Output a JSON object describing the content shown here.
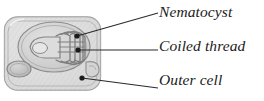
{
  "figure": {
    "name": "nematocyst-cnidocyte-diagram",
    "type": "labeled biological diagram",
    "background_color": "#ffffff",
    "label_text_color": "#1b1b1b",
    "leader_line_color": "#2a2a2a",
    "cell_fill_color": "#dcdcdc",
    "cell_outline_color": "#9a9a9a",
    "capsule_fill_color": "#cfcfcf",
    "thread_color": "#7d7d7d"
  },
  "labels": [
    {
      "id": "nematocyst",
      "text": "Nematocyst",
      "leader": "diagonal"
    },
    {
      "id": "coiled_thread",
      "text": "Coiled thread",
      "leader": "horizontal"
    },
    {
      "id": "outer_cell",
      "text": "Outer cell",
      "leader": "diagonal"
    }
  ],
  "structures": [
    {
      "name": "outer-cell-body",
      "shape": "rounded rectangle"
    },
    {
      "name": "nematocyst-capsule",
      "shape": "oval"
    },
    {
      "name": "coiled-thread",
      "shape": "coiled loops"
    },
    {
      "name": "nucleus",
      "shape": "oval"
    },
    {
      "name": "barb",
      "shape": "hook"
    }
  ]
}
